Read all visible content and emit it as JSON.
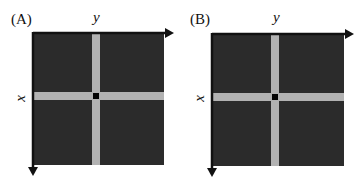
{
  "colors": {
    "field": "#2b2b2b",
    "band": "#b2b2b2",
    "center": "#050505",
    "axis": "#111111",
    "background": "#ffffff"
  },
  "panels": [
    {
      "label": "(A)",
      "x_axis_label": "x",
      "y_axis_label": "y",
      "description": "Dark square field with a light gray cross (row and column band) intersecting at a black center pixel; y axis arrow to the right along top, x axis arrow downward along left."
    },
    {
      "label": "(B)",
      "x_axis_label": "x",
      "y_axis_label": "y",
      "description": "Dark square field with a light gray cross (row and column band) intersecting at a black center pixel; y axis arrow to the right along top, x axis arrow downward along left."
    }
  ]
}
